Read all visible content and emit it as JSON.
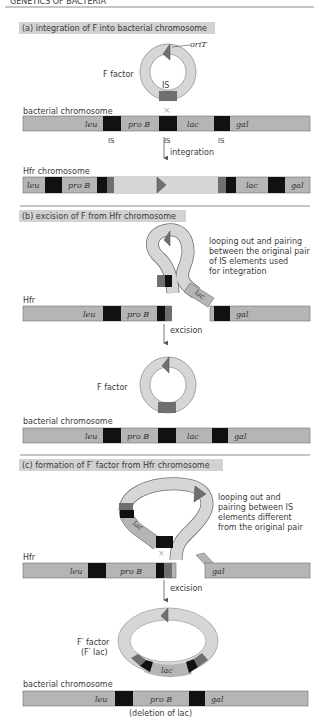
{
  "header": {
    "partial_text": "GENETICS OF BACTERIA"
  },
  "colors": {
    "chromosome": "#b5b5b5",
    "chromosome_edge": "#6e6e6e",
    "f_factor": "#d6d6d6",
    "is_element": "#111111",
    "is_f": "#6f6f6f",
    "title_bg": "#d2d2d2",
    "divider": "#8c8c8c"
  },
  "panel_a": {
    "title": "(a)  integration of F into bacterial chromosome",
    "orit_label": "oriT",
    "f_factor_label": "F factor",
    "is_label": "IS",
    "chromosome_label": "bacterial chromosome",
    "genes": [
      "leu",
      "pro B",
      "lac",
      "gal"
    ],
    "is_labels": [
      "IS",
      "IS",
      "IS"
    ],
    "arrow_label": "integration",
    "hfr_label": "Hfr chromosome",
    "hfr_genes": [
      "leu",
      "pro B",
      "lac",
      "gal"
    ]
  },
  "panel_b": {
    "title": "(b)  excision of F from Hfr chromosome",
    "annotation": [
      "looping out and pairing",
      "between the original pair",
      "of IS elements used",
      "for integration"
    ],
    "hfr_label": "Hfr",
    "genes": [
      "leu",
      "pro B",
      "lac",
      "gal"
    ],
    "arrow_label": "excision",
    "f_factor_label": "F factor",
    "chromosome_label": "bacterial chromosome",
    "result_genes": [
      "leu",
      "pro B",
      "lac",
      "gal"
    ]
  },
  "panel_c": {
    "title": "(c)  formation of F′ factor from Hfr chromosome",
    "annotation": [
      "looping out and",
      "pairing between IS",
      "elements different",
      "from the original pair"
    ],
    "hfr_label": "Hfr",
    "genes": [
      "leu",
      "pro B",
      "lac",
      "gal"
    ],
    "arrow_label": "excision",
    "fprime_label": "F′ factor",
    "fprime_sub_label": "(F′ lac)",
    "fprime_gene": "lac",
    "chromosome_label": "bacterial chromosome",
    "result_genes": [
      "leu",
      "pro B",
      "gal"
    ],
    "deletion_label": "(deletion of lac)"
  }
}
